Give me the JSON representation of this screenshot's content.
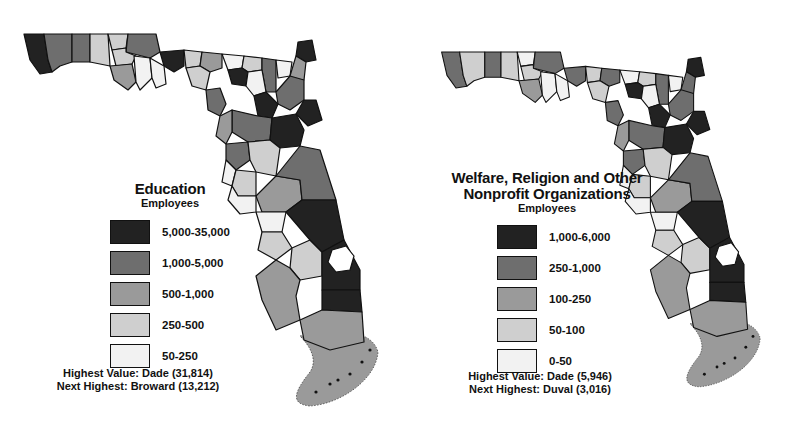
{
  "maps": [
    {
      "id": "education",
      "title": "Education",
      "title_lines": [
        "Education"
      ],
      "subtitle": "Employees",
      "legend": [
        {
          "range": "5,000-35,000",
          "shade": "#222222"
        },
        {
          "range": "1,000-5,000",
          "shade": "#6e6e6e"
        },
        {
          "range": "500-1,000",
          "shade": "#9a9a9a"
        },
        {
          "range": "250-500",
          "shade": "#cfcfcf"
        },
        {
          "range": "50-250",
          "shade": "#f2f2f2"
        }
      ],
      "highest": "Highest Value: Dade (31,814)",
      "next_highest": "Next Highest: Broward (13,212)"
    },
    {
      "id": "welfare",
      "title": "Welfare, Religion and Other Nonprofit Organizations",
      "title_lines": [
        "Welfare, Religion and Other",
        "Nonprofit Organizations"
      ],
      "subtitle": "Employees",
      "legend": [
        {
          "range": "1,000-6,000",
          "shade": "#222222"
        },
        {
          "range": "250-1,000",
          "shade": "#6e6e6e"
        },
        {
          "range": "100-250",
          "shade": "#9a9a9a"
        },
        {
          "range": "50-100",
          "shade": "#cfcfcf"
        },
        {
          "range": "0-50",
          "shade": "#f2f2f2"
        }
      ],
      "highest": "Highest Value: Dade (5,946)",
      "next_highest": "Next Highest: Duval (3,016)"
    }
  ],
  "region": "Florida counties",
  "county_classes": {
    "education": [
      0,
      1,
      1,
      3,
      3,
      1,
      3,
      2,
      4,
      0,
      4,
      3,
      2,
      4,
      3,
      1,
      4,
      3,
      0,
      4,
      0,
      2,
      1,
      1,
      0,
      0,
      1,
      0,
      2,
      1,
      3,
      4,
      3,
      2,
      1,
      4,
      3,
      3,
      2,
      0,
      0,
      0,
      4,
      2
    ],
    "welfare": [
      1,
      3,
      1,
      3,
      4,
      1,
      3,
      2,
      4,
      1,
      4,
      3,
      1,
      4,
      3,
      1,
      4,
      3,
      0,
      4,
      0,
      1,
      1,
      1,
      0,
      0,
      1,
      0,
      2,
      1,
      3,
      4,
      3,
      2,
      1,
      4,
      3,
      3,
      2,
      0,
      0,
      0,
      4,
      2
    ]
  }
}
